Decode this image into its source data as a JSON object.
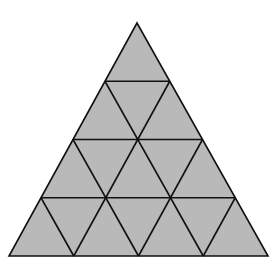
{
  "diagram": {
    "rows": 4,
    "small_triangle_count": 16,
    "fill_color": "#b9b9b9",
    "line_color": "#111111",
    "background": "#ffffff",
    "apex": [
      137,
      23
    ],
    "base_left": [
      9,
      256
    ],
    "base_right": [
      268,
      256
    ]
  }
}
